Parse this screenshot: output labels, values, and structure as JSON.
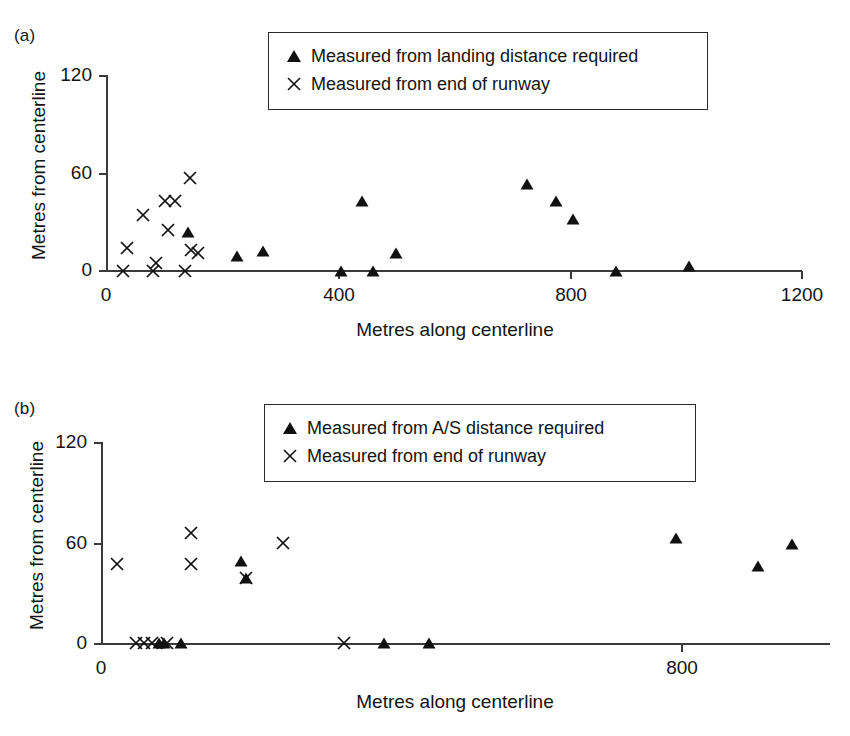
{
  "figure": {
    "panels": [
      {
        "id": "a",
        "label": "(a)",
        "legend": [
          {
            "marker": "triangle",
            "label": "Measured from landing distance required"
          },
          {
            "marker": "cross",
            "label": "Measured from end of runway"
          }
        ],
        "chart_data": {
          "type": "scatter",
          "title": "(a)",
          "xlabel": "Metres along centerline",
          "ylabel": "Metres from centerline",
          "xlim": [
            0,
            1200
          ],
          "ylim": [
            0,
            120
          ],
          "xticks": [
            0,
            400,
            800,
            1200
          ],
          "yticks": [
            0,
            60,
            120
          ],
          "xticklabels": [
            "0",
            "400",
            "800",
            "1200"
          ],
          "yticklabels": [
            "0",
            "60",
            "120"
          ],
          "grid": false,
          "legend_position": "top-center",
          "series": [
            {
              "name": "Measured from landing distance required",
              "marker": "triangle",
              "points": [
                [
                  140,
                  24
                ],
                [
                  225,
                  9
                ],
                [
                  270,
                  12
                ],
                [
                  405,
                  0
                ],
                [
                  460,
                  0
                ],
                [
                  440,
                  43
                ],
                [
                  500,
                  11
                ],
                [
                  725,
                  53
                ],
                [
                  775,
                  43
                ],
                [
                  805,
                  32
                ],
                [
                  880,
                  0
                ],
                [
                  1005,
                  3
                ]
              ]
            },
            {
              "name": "Measured from end of runway",
              "marker": "cross",
              "points": [
                [
                  28,
                  0
                ],
                [
                  35,
                  14
                ],
                [
                  62,
                  34
                ],
                [
                  80,
                  0
                ],
                [
                  85,
                  5
                ],
                [
                  100,
                  43
                ],
                [
                  105,
                  25
                ],
                [
                  118,
                  43
                ],
                [
                  135,
                  0
                ],
                [
                  143,
                  57
                ],
                [
                  145,
                  13
                ],
                [
                  157,
                  11
                ]
              ]
            }
          ]
        }
      },
      {
        "id": "b",
        "label": "(b)",
        "legend": [
          {
            "marker": "triangle",
            "label": "Measured from A/S distance required"
          },
          {
            "marker": "cross",
            "label": "Measured from end of runway"
          }
        ],
        "chart_data": {
          "type": "scatter",
          "title": "(b)",
          "xlabel": "Metres along centerline",
          "ylabel": "Metres from centerline",
          "xlim": [
            0,
            1005
          ],
          "ylim": [
            0,
            120
          ],
          "xticks": [
            0,
            800
          ],
          "yticks": [
            0,
            60,
            120
          ],
          "xticklabels": [
            "0",
            "800"
          ],
          "yticklabels": [
            "0",
            "60",
            "120"
          ],
          "grid": false,
          "legend_position": "top-center",
          "series": [
            {
              "name": "Measured from A/S distance required",
              "marker": "triangle",
              "points": [
                [
                  80,
                  0
                ],
                [
                  86,
                  0
                ],
                [
                  110,
                  0
                ],
                [
                  193,
                  49
                ],
                [
                  199,
                  39
                ],
                [
                  390,
                  0
                ],
                [
                  452,
                  0
                ],
                [
                  792,
                  63
                ],
                [
                  905,
                  46
                ],
                [
                  953,
                  59
                ]
              ]
            },
            {
              "name": "Measured from end of runway",
              "marker": "cross",
              "points": [
                [
                  22,
                  47
                ],
                [
                  48,
                  0
                ],
                [
                  59,
                  0
                ],
                [
                  69,
                  0
                ],
                [
                  91,
                  0
                ],
                [
                  123,
                  66
                ],
                [
                  123,
                  47
                ],
                [
                  199,
                  39
                ],
                [
                  250,
                  60
                ],
                [
                  335,
                  0
                ]
              ]
            }
          ]
        }
      }
    ]
  }
}
